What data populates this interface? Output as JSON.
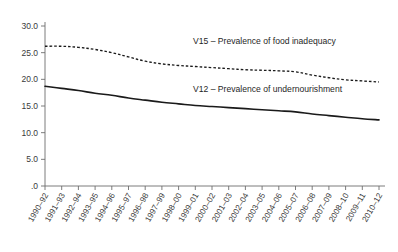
{
  "chart_data": {
    "type": "line",
    "title": "",
    "xlabel": "",
    "ylabel": "",
    "ylim": [
      0,
      30
    ],
    "ytick_labels": [
      "30.0",
      "25.0",
      "20.0",
      "15.0",
      "10.0",
      "5.0",
      ".0"
    ],
    "ytick_values": [
      30,
      25,
      20,
      15,
      10,
      5,
      0
    ],
    "grid": false,
    "legend_position": "inline-annotation",
    "categories": [
      "1990–92",
      "1991–93",
      "1992–94",
      "1993–95",
      "1994–96",
      "1995–97",
      "1996–98",
      "1997–99",
      "1998–00",
      "1999–01",
      "2000–02",
      "2001–03",
      "2002–04",
      "2003–05",
      "2004–06",
      "2005–07",
      "2006–08",
      "2007–09",
      "2008–10",
      "2009–11",
      "2010–12"
    ],
    "series": [
      {
        "name": "V15 – Prevalence of food inadequacy",
        "style": "dashed",
        "color": "#1a1a1a",
        "values": [
          26.2,
          26.2,
          26.0,
          25.6,
          25.0,
          24.2,
          23.4,
          22.9,
          22.6,
          22.4,
          22.2,
          22.0,
          21.8,
          21.7,
          21.6,
          21.4,
          20.8,
          20.3,
          19.9,
          19.7,
          19.5
        ]
      },
      {
        "name": "V12 – Prevalence of undernourishment",
        "style": "solid",
        "color": "#1a1a1a",
        "values": [
          18.7,
          18.3,
          17.9,
          17.4,
          17.0,
          16.5,
          16.1,
          15.7,
          15.4,
          15.1,
          14.9,
          14.7,
          14.5,
          14.3,
          14.1,
          13.9,
          13.5,
          13.2,
          12.9,
          12.6,
          12.4
        ]
      }
    ],
    "annotations": [
      {
        "text": "V15 – Prevalence of food inadequacy",
        "x_px": 193,
        "y_px": 44
      },
      {
        "text": "V12 – Prevalence of undernourishment",
        "x_px": 193,
        "y_px": 92
      }
    ]
  }
}
